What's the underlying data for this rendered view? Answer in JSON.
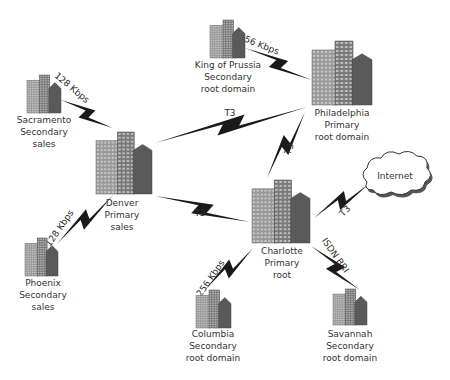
{
  "diagram": {
    "type": "network-topology",
    "colors": {
      "bolt": "#1a1a1a",
      "building_light": "#9a9a9a",
      "building_mid": "#7a7a7a",
      "building_dark": "#5a5a5a",
      "window": "#d8d8d8",
      "text": "#333333",
      "cloud_fill": "#ffffff",
      "cloud_stroke": "#333333"
    },
    "nodes": [
      {
        "id": "sacramento",
        "lines": [
          "Sacramento",
          "Secondary",
          "sales"
        ],
        "kind": "building",
        "size": "small"
      },
      {
        "id": "king-of-prussia",
        "lines": [
          "King of Prussia",
          "Secondary",
          "root domain"
        ],
        "kind": "building",
        "size": "small"
      },
      {
        "id": "philadelphia",
        "lines": [
          "Philadelphia",
          "Primary",
          "root domain"
        ],
        "kind": "building",
        "size": "large"
      },
      {
        "id": "denver",
        "lines": [
          "Denver",
          "Primary",
          "sales"
        ],
        "kind": "building",
        "size": "large"
      },
      {
        "id": "charlotte",
        "lines": [
          "Charlotte",
          "Primary",
          "root"
        ],
        "kind": "building",
        "size": "large"
      },
      {
        "id": "phoenix",
        "lines": [
          "Phoenix",
          "Secondary",
          "sales"
        ],
        "kind": "building",
        "size": "small"
      },
      {
        "id": "columbia",
        "lines": [
          "Columbia",
          "Secondary",
          "root domain"
        ],
        "kind": "building",
        "size": "small"
      },
      {
        "id": "savannah",
        "lines": [
          "Savannah",
          "Secondary",
          "root domain"
        ],
        "kind": "building",
        "size": "small"
      },
      {
        "id": "internet",
        "lines": [
          "Internet"
        ],
        "kind": "cloud"
      }
    ],
    "links": [
      {
        "from": "sacramento",
        "to": "denver",
        "label": "128 Kbps"
      },
      {
        "from": "king-of-prussia",
        "to": "philadelphia",
        "label": "256 Kbps"
      },
      {
        "from": "denver",
        "to": "philadelphia",
        "label": "T3"
      },
      {
        "from": "philadelphia",
        "to": "charlotte",
        "label": "T3"
      },
      {
        "from": "denver",
        "to": "phoenix",
        "label": "128 Kbps"
      },
      {
        "from": "denver",
        "to": "charlotte",
        "label": "T3"
      },
      {
        "from": "charlotte",
        "to": "internet",
        "label": "T3"
      },
      {
        "from": "charlotte",
        "to": "columbia",
        "label": "256 Kbps"
      },
      {
        "from": "charlotte",
        "to": "savannah",
        "label": "ISDN BRI"
      }
    ]
  }
}
